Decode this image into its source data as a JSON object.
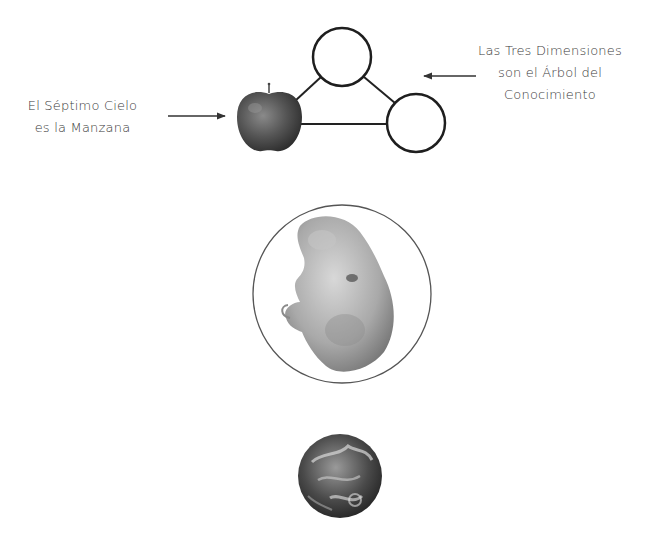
{
  "diagram": {
    "left_label": {
      "line1": "El Séptimo Cielo",
      "line2": "es la Manzana"
    },
    "right_label": {
      "line1": "Las Tres Dimensiones",
      "line2": "son el Árbol del",
      "line3": "Conocimiento"
    },
    "nodes": [
      {
        "id": "apple",
        "type": "image",
        "depicts": "apple"
      },
      {
        "id": "top-circle",
        "type": "empty-circle"
      },
      {
        "id": "right-circle",
        "type": "empty-circle"
      },
      {
        "id": "embryo",
        "type": "image-in-circle",
        "depicts": "embryo"
      },
      {
        "id": "earth",
        "type": "image",
        "depicts": "earth-globe"
      }
    ],
    "edges": [
      {
        "from": "apple",
        "to": "top-circle"
      },
      {
        "from": "top-circle",
        "to": "right-circle"
      },
      {
        "from": "apple",
        "to": "right-circle"
      }
    ],
    "arrows": [
      {
        "from": "left_label",
        "to": "apple",
        "direction": "right"
      },
      {
        "from": "right_label",
        "to": "triangle",
        "direction": "left"
      }
    ],
    "colors": {
      "line": "#222222",
      "text": "#3a3a3a",
      "background": "#ffffff"
    }
  }
}
